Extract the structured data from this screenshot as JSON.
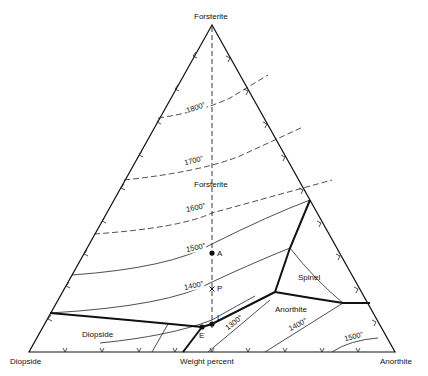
{
  "diagram": {
    "type": "ternary phase diagram",
    "vertices": {
      "top": "Forsterite",
      "bottom_left": "Diopside",
      "bottom_right": "Anorthite"
    },
    "axis_caption": "Weight percent",
    "fields": [
      {
        "name": "Forsterite"
      },
      {
        "name": "Spinel"
      },
      {
        "name": "Anorthite"
      },
      {
        "name": "Diopside"
      }
    ],
    "isotherms": [
      {
        "label": "1800°",
        "style": "dashed"
      },
      {
        "label": "1700°",
        "style": "dashed"
      },
      {
        "label": "1600°",
        "style": "dashed"
      },
      {
        "label": "1500°",
        "style": "solid"
      },
      {
        "label": "1400°",
        "style": "solid"
      },
      {
        "label": "1300°",
        "style": "solid"
      },
      {
        "label": "1400°",
        "style": "solid",
        "field": "Anorthite"
      },
      {
        "label": "1500°",
        "style": "solid",
        "field": "Anorthite"
      }
    ],
    "points": [
      {
        "label": "A",
        "marker": "dot"
      },
      {
        "label": "P",
        "marker": "x"
      },
      {
        "label": "L",
        "marker": "dot"
      },
      {
        "label": "E",
        "marker": "dot"
      }
    ]
  }
}
